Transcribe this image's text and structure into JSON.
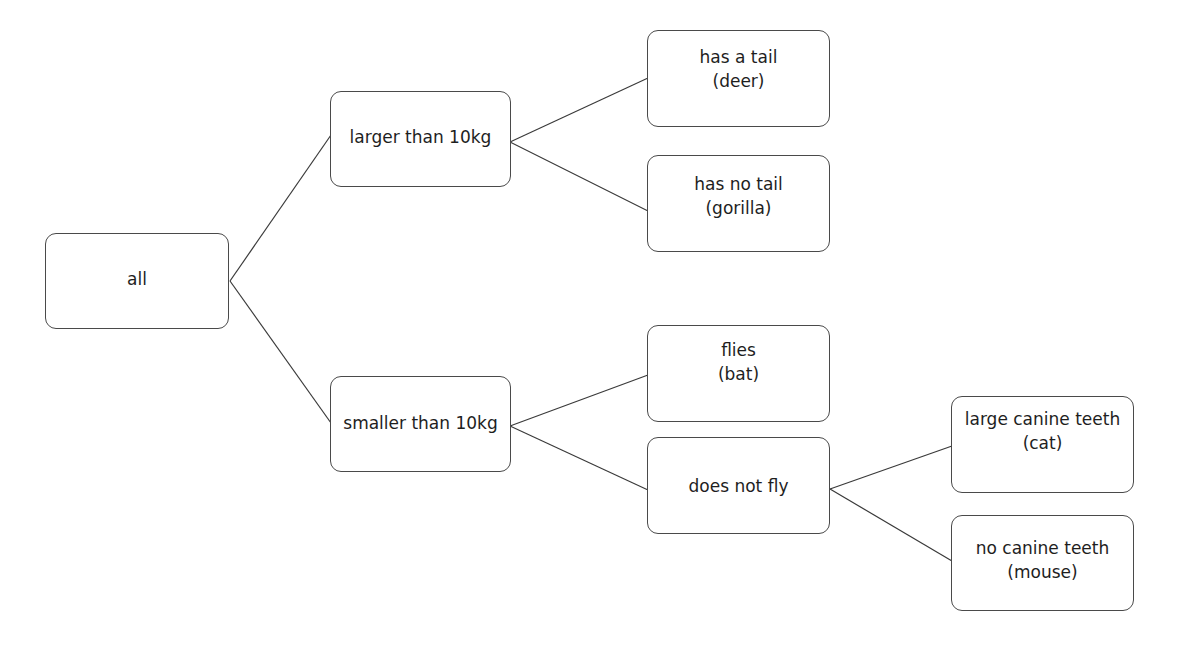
{
  "diagram": {
    "type": "decision-tree",
    "colors": {
      "background": "#ffffff",
      "stroke": "#4a4a4a",
      "text": "#1e1e1e"
    },
    "nodes": {
      "all": {
        "line1": "all"
      },
      "larger": {
        "line1": "larger than 10kg"
      },
      "smaller": {
        "line1": "smaller than 10kg"
      },
      "deer": {
        "line1": "has a tail",
        "line2": "(deer)"
      },
      "gorilla": {
        "line1": "has no tail",
        "line2": "(gorilla)"
      },
      "bat": {
        "line1": "flies",
        "line2": "(bat)"
      },
      "not_fly": {
        "line1": "does not fly"
      },
      "cat": {
        "line1": "large canine teeth",
        "line2": "(cat)"
      },
      "mouse": {
        "line1": "no canine teeth",
        "line2": "(mouse)"
      }
    },
    "edges": [
      {
        "from": "all",
        "to": "larger"
      },
      {
        "from": "all",
        "to": "smaller"
      },
      {
        "from": "larger",
        "to": "deer"
      },
      {
        "from": "larger",
        "to": "gorilla"
      },
      {
        "from": "smaller",
        "to": "bat"
      },
      {
        "from": "smaller",
        "to": "not_fly"
      },
      {
        "from": "not_fly",
        "to": "cat"
      },
      {
        "from": "not_fly",
        "to": "mouse"
      }
    ]
  }
}
